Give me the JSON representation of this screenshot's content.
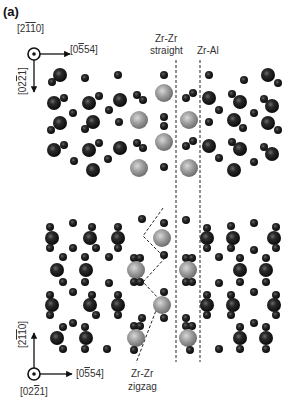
{
  "figure": {
    "panel_label": "(a)",
    "top_axes": {
      "out_of_plane": "[2¯1¯10]",
      "horizontal": "[0¯554]",
      "vertical": "[02¯21]"
    },
    "bottom_axes": {
      "vertical": "[2¯1¯10]",
      "out_of_plane": "[02¯21]",
      "horizontal": "[0¯554]"
    },
    "annotations": {
      "zr_zr_straight_line1": "Zr-Zr",
      "zr_zr_straight_line2": "straight",
      "zr_al": "Zr-Al",
      "zr_zr_zigzag_line1": "Zr-Zr",
      "zr_zr_zigzag_line2": "zigzag"
    },
    "legend_colors": {
      "zr_atom": "#9a9a9a",
      "dark_atom": "#1a1a1a",
      "dashed_line": "#222222"
    }
  }
}
